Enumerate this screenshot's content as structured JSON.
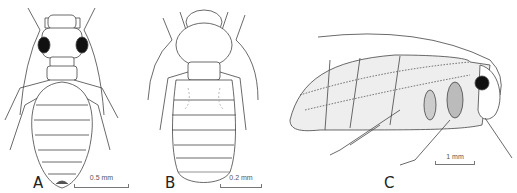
{
  "figure": {
    "panels": [
      {
        "label": "A",
        "scale": "0.5 mm",
        "subject": "dorsal view wingless insect (larger eyes)"
      },
      {
        "label": "B",
        "scale": "0.2 mm",
        "subject": "dorsal view wingless insect (small eyes)"
      },
      {
        "label": "C",
        "scale": "1 mm",
        "subject": "lateral view winged insect"
      }
    ],
    "colors": {
      "ink": "#333333",
      "shade": "#bbbbbb",
      "background": "#ffffff"
    }
  }
}
